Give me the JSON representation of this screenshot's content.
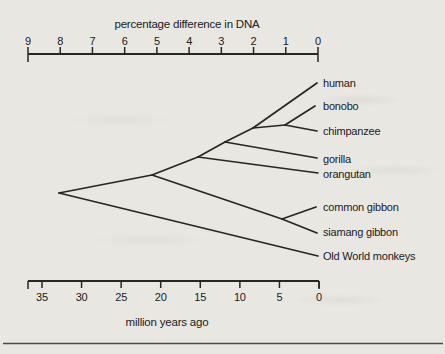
{
  "colors": {
    "paper": "#e9e7e2",
    "ink": "#262624",
    "rule": "#4a4a48"
  },
  "chart_data": {
    "type": "phylogenetic-tree",
    "top_axis": {
      "title": "percentage difference in DNA",
      "ticks": [
        "9",
        "8",
        "7",
        "6",
        "5",
        "4",
        "3",
        "2",
        "1",
        "0"
      ],
      "range": [
        9,
        0
      ],
      "x0": 28,
      "x1": 318,
      "line_y": 54,
      "title_x": 187,
      "title_y": 28
    },
    "bottom_axis": {
      "title": "million years ago",
      "ticks": [
        "35",
        "30",
        "25",
        "20",
        "15",
        "10",
        "5",
        "0"
      ],
      "range_drawn": [
        36.8,
        0
      ],
      "x0": 28,
      "x1": 319,
      "tick_x0": 42,
      "line_y": 281,
      "title_x": 167,
      "title_y": 326
    },
    "taxa": [
      {
        "name": "human",
        "label_x": 323,
        "label_y": 83
      },
      {
        "name": "bonobo",
        "label_x": 323,
        "label_y": 106
      },
      {
        "name": "chimpanzee",
        "label_x": 323,
        "label_y": 131
      },
      {
        "name": "gorilla",
        "label_x": 323,
        "label_y": 159
      },
      {
        "name": "orangutan",
        "label_x": 323,
        "label_y": 174
      },
      {
        "name": "common gibbon",
        "label_x": 323,
        "label_y": 207
      },
      {
        "name": "siamang gibbon",
        "label_x": 323,
        "label_y": 232
      },
      {
        "name": "Old World monkeys",
        "label_x": 323,
        "label_y": 256
      }
    ],
    "divergence_estimates_mya": {
      "old_world_monkeys": 33,
      "gibbons": 21,
      "orangutan": 15,
      "gorilla": 12,
      "human": 8,
      "bonobo_chimpanzee": 4.5,
      "common_vs_siamang_gibbon": 4.7
    },
    "edges": [
      {
        "id": "edge-root-apes",
        "x1": 59,
        "y1": 193,
        "x2": 152,
        "y2": 175
      },
      {
        "id": "edge-great-apes",
        "x1": 152,
        "y1": 175,
        "x2": 198,
        "y2": 157
      },
      {
        "id": "edge-african-apes",
        "x1": 198,
        "y1": 157,
        "x2": 225,
        "y2": 142
      },
      {
        "id": "edge-homininae",
        "x1": 225,
        "y1": 142,
        "x2": 253,
        "y2": 128
      },
      {
        "id": "edge-pan-lineage",
        "x1": 253,
        "y1": 128,
        "x2": 285,
        "y2": 125
      },
      {
        "id": "edge-human",
        "x1": 253,
        "y1": 128,
        "x2": 317,
        "y2": 83
      },
      {
        "id": "edge-bonobo",
        "x1": 285,
        "y1": 125,
        "x2": 315,
        "y2": 106
      },
      {
        "id": "edge-chimpanzee",
        "x1": 285,
        "y1": 125,
        "x2": 317,
        "y2": 131
      },
      {
        "id": "edge-gorilla",
        "x1": 225,
        "y1": 142,
        "x2": 317,
        "y2": 158
      },
      {
        "id": "edge-orangutan",
        "x1": 198,
        "y1": 157,
        "x2": 318,
        "y2": 173
      },
      {
        "id": "edge-gibbons",
        "x1": 152,
        "y1": 175,
        "x2": 282,
        "y2": 219
      },
      {
        "id": "edge-common-gibbon",
        "x1": 282,
        "y1": 219,
        "x2": 316,
        "y2": 207
      },
      {
        "id": "edge-siamang-gibbon",
        "x1": 282,
        "y1": 219,
        "x2": 317,
        "y2": 233
      },
      {
        "id": "edge-old-world-monkeys",
        "x1": 59,
        "y1": 193,
        "x2": 318,
        "y2": 256
      }
    ],
    "separator_rule": {
      "x0": 3,
      "x1": 443,
      "y": 343.5
    }
  }
}
